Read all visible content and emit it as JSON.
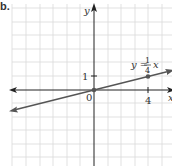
{
  "problem": {
    "part_label": "b."
  },
  "graph": {
    "origin_px": [
      94,
      90
    ],
    "unit_px": 13.5,
    "grid": {
      "x_lines": [
        12,
        26,
        40,
        53,
        67,
        80,
        108,
        121,
        135,
        148,
        162
      ],
      "y_lines": [
        8,
        22,
        35,
        49,
        62,
        76,
        103,
        117,
        130,
        144,
        157
      ],
      "left": 12,
      "right": 172,
      "top": 4,
      "bottom": 166,
      "color": "#d9d9d9"
    },
    "axes": {
      "color": "#222222",
      "x_label": "x",
      "y_label": "y",
      "origin_label": "0",
      "x_tick_label": "4",
      "y_tick_label": "1"
    },
    "line": {
      "color": "#555555",
      "equation": {
        "lhs": "y =",
        "frac_num": "1",
        "frac_den": "4",
        "var": "x"
      },
      "points": [
        [
          0,
          0
        ],
        [
          4,
          1
        ]
      ]
    }
  },
  "chart_data": {
    "type": "line",
    "title": "",
    "xlabel": "x",
    "ylabel": "y",
    "series": [
      {
        "name": "y = (1/4)x",
        "x": [
          -6,
          0,
          4,
          6
        ],
        "y": [
          -1.5,
          0,
          1,
          1.5
        ]
      }
    ],
    "highlighted_points": [
      [
        0,
        0
      ],
      [
        4,
        1
      ]
    ],
    "tick_labels": {
      "x": [
        "4"
      ],
      "y": [
        "1"
      ]
    },
    "origin_label": "0",
    "xlim": [
      -6,
      6
    ],
    "ylim": [
      -6,
      6
    ],
    "grid": true
  }
}
